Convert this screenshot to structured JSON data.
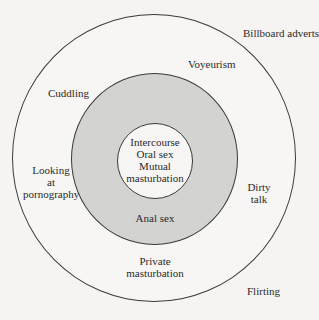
{
  "diagram": {
    "type": "concentric-circles",
    "rings": [
      {
        "id": "outer",
        "fill": "#f7f6f4"
      },
      {
        "id": "middle",
        "fill": "#d3d3d1"
      },
      {
        "id": "inner",
        "fill": "#f7f6f4"
      }
    ],
    "labels": {
      "billboard": "Billboard adverts",
      "voyeurism": "Voyeurism",
      "cuddling": "Cuddling",
      "looking": [
        "Looking",
        "at",
        "pornography"
      ],
      "core": [
        "Intercourse",
        "Oral sex",
        "Mutual",
        "masturbation"
      ],
      "anal": "Anal sex",
      "dirty_talk": [
        "Dirty",
        "talk"
      ],
      "private": [
        "Private",
        "masturbation"
      ],
      "flirting": "Flirting"
    }
  }
}
